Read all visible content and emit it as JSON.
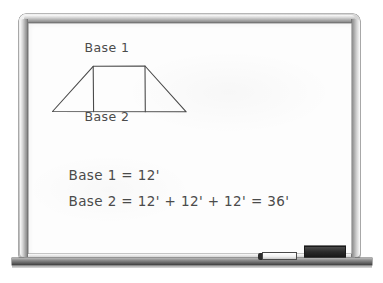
{
  "scene": {
    "title": "Classroom whiteboard with trapezoid geometry problem",
    "surface_color": "#fdfdfd",
    "frame_color": "#b4b4b4",
    "ink_color": "#4b4b4b"
  },
  "diagram": {
    "shape": "trapezoid",
    "top_label": "Base 1",
    "bottom_label": "Base 2",
    "divider_count": 2,
    "section_count": 3,
    "geometry": {
      "bottom_left": [
        24,
        88
      ],
      "bottom_right": [
        158,
        88
      ],
      "top_left": [
        65,
        43
      ],
      "top_right": [
        117,
        43
      ],
      "divider_x": [
        65,
        117
      ]
    }
  },
  "equations": [
    {
      "id": "line-1",
      "text": "Base 1 = 12'"
    },
    {
      "id": "line-2",
      "text": "Base 2 = 12' + 12' + 12' = 36'"
    }
  ],
  "tray": {
    "marker_label": "dry-erase marker",
    "eraser_label": "whiteboard eraser"
  }
}
